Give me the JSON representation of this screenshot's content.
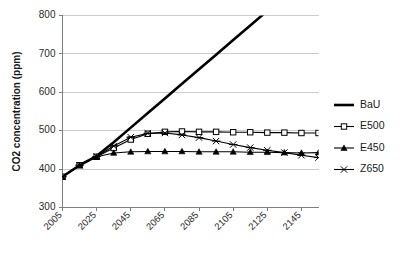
{
  "chart_data": {
    "type": "line",
    "title": "",
    "xlabel": "",
    "ylabel": "CO2 concentration (ppm)",
    "xlim": [
      2005,
      2155
    ],
    "ylim": [
      300,
      800
    ],
    "ytick_values": [
      300,
      400,
      500,
      600,
      700,
      800
    ],
    "ytick_labels": [
      "300",
      "400",
      "500",
      "600",
      "700",
      "800"
    ],
    "xtick_values": [
      2005,
      2025,
      2045,
      2065,
      2085,
      2105,
      2125,
      2145
    ],
    "xtick_labels": [
      "2005",
      "2025",
      "2045",
      "2065",
      "2085",
      "2105",
      "2125",
      "2145"
    ],
    "grid": "horizontal",
    "legend_position": "right",
    "x": [
      2005,
      2015,
      2025,
      2035,
      2045,
      2055,
      2065,
      2075,
      2085,
      2095,
      2105,
      2115,
      2125,
      2135,
      2145,
      2155
    ],
    "series": [
      {
        "name": "BaU",
        "marker": "none",
        "line_width": 2.6,
        "color": "#000000",
        "values": [
          380,
          410,
          434,
          470,
          508,
          546,
          584,
          622,
          660,
          698,
          736,
          774,
          812,
          850,
          888,
          926
        ],
        "clipped_above_ylim": true
      },
      {
        "name": "E500",
        "marker": "open-square",
        "line_width": 1.1,
        "color": "#000000",
        "values": [
          380,
          410,
          432,
          455,
          477,
          492,
          497,
          498,
          497,
          497,
          496,
          496,
          495,
          495,
          494,
          494
        ]
      },
      {
        "name": "E450",
        "marker": "filled-triangle",
        "line_width": 1.1,
        "color": "#000000",
        "values": [
          380,
          410,
          432,
          442,
          445,
          446,
          446,
          446,
          445,
          445,
          445,
          444,
          444,
          443,
          442,
          443
        ]
      },
      {
        "name": "Z650",
        "marker": "cross",
        "line_width": 1.1,
        "color": "#000000",
        "values": [
          380,
          410,
          433,
          460,
          483,
          493,
          494,
          489,
          482,
          473,
          464,
          456,
          449,
          443,
          436,
          430
        ]
      }
    ],
    "legend": [
      {
        "label": "BaU",
        "marker": "none",
        "line_width": 2.6,
        "color": "#000000"
      },
      {
        "label": "E500",
        "marker": "open-square",
        "line_width": 1.1,
        "color": "#000000"
      },
      {
        "label": "E450",
        "marker": "filled-triangle",
        "line_width": 1.1,
        "color": "#000000"
      },
      {
        "label": "Z650",
        "marker": "cross",
        "line_width": 1.1,
        "color": "#000000"
      }
    ]
  },
  "colors": {
    "background": "#ffffff",
    "gridline": "#bfbfbf",
    "axis": "#808080",
    "text": "#1a1a1a",
    "series": "#000000"
  }
}
